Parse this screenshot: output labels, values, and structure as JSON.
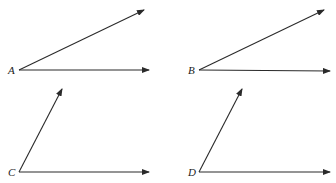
{
  "diagram": {
    "type": "angle-comparison",
    "stroke_color": "#2a2a2a",
    "angles": [
      {
        "label": "A",
        "label_pos": [
          8,
          74
        ],
        "vertex": [
          19,
          70
        ],
        "ray_upper_end": [
          144,
          10
        ],
        "ray_lower_end": [
          149,
          70
        ]
      },
      {
        "label": "B",
        "label_pos": [
          188,
          74
        ],
        "vertex": [
          199,
          70
        ],
        "ray_upper_end": [
          324,
          10
        ],
        "ray_lower_end": [
          330,
          71
        ]
      },
      {
        "label": "C",
        "label_pos": [
          8,
          176
        ],
        "vertex": [
          19,
          172
        ],
        "ray_upper_end": [
          62,
          89
        ],
        "ray_lower_end": [
          149,
          172
        ]
      },
      {
        "label": "D",
        "label_pos": [
          188,
          176
        ],
        "vertex": [
          199,
          172
        ],
        "ray_upper_end": [
          242,
          89
        ],
        "ray_lower_end": [
          330,
          172
        ]
      }
    ]
  }
}
